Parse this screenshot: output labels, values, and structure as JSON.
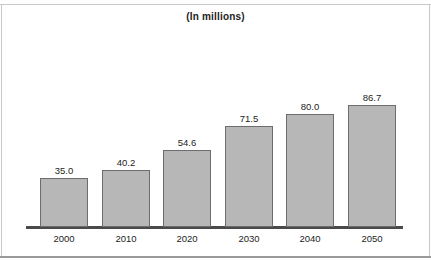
{
  "chart_data": {
    "type": "bar",
    "title": "(In millions)",
    "xlabel": "",
    "ylabel": "",
    "categories": [
      "2000",
      "2010",
      "2020",
      "2030",
      "2040",
      "2050"
    ],
    "values": [
      35.0,
      40.2,
      54.6,
      71.5,
      80.0,
      86.7
    ],
    "value_labels": [
      "35.0",
      "40.2",
      "54.6",
      "71.5",
      "80.0",
      "86.7"
    ],
    "ylim": [
      0,
      96
    ],
    "grid": false,
    "legend": null,
    "axis_visible": {
      "x": true,
      "y": false
    },
    "tick_labels": {
      "x": [
        "2000",
        "2010",
        "2020",
        "2030",
        "2040",
        "2050"
      ],
      "y": []
    },
    "colors": {
      "bar_fill": "#b7b7b7",
      "bar_border": "#6d6d6d",
      "axis": "#4a4a4a",
      "text": "#1d1d1d",
      "frame": "#c8c8c8",
      "background": "#ffffff"
    }
  }
}
